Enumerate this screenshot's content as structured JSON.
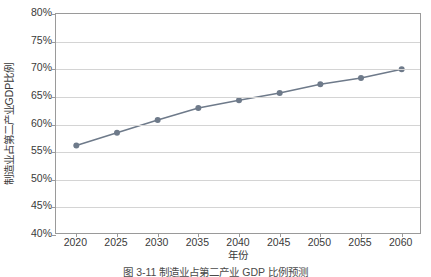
{
  "figure": {
    "caption": "图 3-11  制造业占第二产业 GDP 比例预测",
    "background_color": "#ffffff"
  },
  "chart_data": {
    "type": "line",
    "title": "",
    "xlabel": "年份",
    "ylabel": "制造业占第二产业GDP比例",
    "categories": [
      "2020",
      "2025",
      "2030",
      "2035",
      "2040",
      "2045",
      "2050",
      "2055",
      "2060"
    ],
    "x": [
      2020,
      2025,
      2030,
      2035,
      2040,
      2045,
      2050,
      2055,
      2060
    ],
    "values": [
      56.2,
      58.5,
      60.8,
      63.0,
      64.4,
      65.7,
      67.3,
      68.4,
      70.0
    ],
    "value_suffix": "%",
    "ylim": [
      40,
      80
    ],
    "ytick_values": [
      80,
      75,
      70,
      65,
      60,
      55,
      50,
      45,
      40
    ],
    "ytick_labels": [
      "80%",
      "75%",
      "70%",
      "65%",
      "60%",
      "55%",
      "50%",
      "45%",
      "40%"
    ],
    "xtick_labels": [
      "2020",
      "2025",
      "2030",
      "2035",
      "2040",
      "2045",
      "2050",
      "2055",
      "2060"
    ],
    "xlim": [
      2017.5,
      2062.5
    ],
    "grid": "horizontal",
    "legend": "none",
    "series_color": "#6e7a8a",
    "marker": "circle",
    "marker_size": 4,
    "line_width": 1.5,
    "gridline_color": "#d4d4d4",
    "axis_color": "#9a9a9a",
    "text_color": "#3a3a3a"
  }
}
